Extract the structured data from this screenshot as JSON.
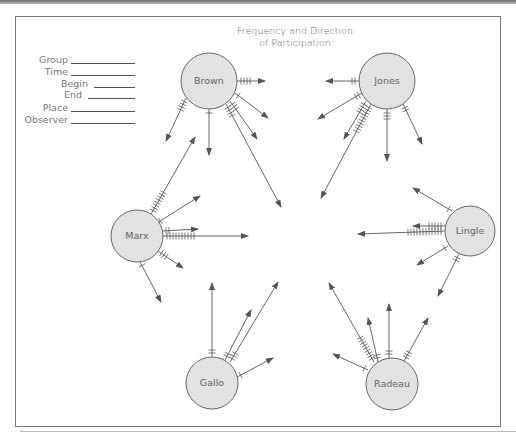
{
  "title": {
    "line1": "Frequency and Direction",
    "line2": "of Participation"
  },
  "form": {
    "fields": [
      {
        "label": "Group"
      },
      {
        "label": "Time"
      },
      {
        "label": "Begin"
      },
      {
        "label": "End"
      },
      {
        "label": "Place"
      },
      {
        "label": "Observer"
      }
    ]
  },
  "colors": {
    "node_fill": "#e2e2e2",
    "node_stroke": "#666666",
    "line": "#555555",
    "text": "#666666"
  },
  "nodes": [
    {
      "id": "brown",
      "label": "Brown",
      "cx": 209,
      "cy": 81,
      "r": 28
    },
    {
      "id": "jones",
      "label": "Jones",
      "cx": 387,
      "cy": 81,
      "r": 28
    },
    {
      "id": "marx",
      "label": "Marx",
      "cx": 137,
      "cy": 236,
      "r": 26
    },
    {
      "id": "lingle",
      "label": "Lingle",
      "cx": 470,
      "cy": 231,
      "r": 25
    },
    {
      "id": "gallo",
      "label": "Gallo",
      "cx": 212,
      "cy": 383,
      "r": 26
    },
    {
      "id": "radeau",
      "label": "Radeau",
      "cx": 392,
      "cy": 384,
      "r": 26
    }
  ],
  "arrows": [
    {
      "from": "brown",
      "x1": 237,
      "y1": 81,
      "x2": 265,
      "y2": 81,
      "ticks": 4
    },
    {
      "from": "brown",
      "x1": 235,
      "y1": 93,
      "x2": 268,
      "y2": 118,
      "ticks": 1
    },
    {
      "from": "brown",
      "x1": 230,
      "y1": 101,
      "x2": 257,
      "y2": 139,
      "ticks": 3
    },
    {
      "from": "brown",
      "x1": 226,
      "y1": 104,
      "x2": 281,
      "y2": 207,
      "ticks": 4
    },
    {
      "from": "brown",
      "x1": 209,
      "y1": 109,
      "x2": 209,
      "y2": 155,
      "ticks": 1
    },
    {
      "from": "brown",
      "x1": 186,
      "y1": 98,
      "x2": 166,
      "y2": 141,
      "ticks": 4
    },
    {
      "from": "jones",
      "x1": 359,
      "y1": 81,
      "x2": 326,
      "y2": 81,
      "ticks": 2
    },
    {
      "from": "jones",
      "x1": 362,
      "y1": 93,
      "x2": 318,
      "y2": 119,
      "ticks": 2
    },
    {
      "from": "jones",
      "x1": 366,
      "y1": 101,
      "x2": 344,
      "y2": 139,
      "ticks": 4
    },
    {
      "from": "jones",
      "x1": 371,
      "y1": 104,
      "x2": 321,
      "y2": 198,
      "ticks": 10
    },
    {
      "from": "jones",
      "x1": 387,
      "y1": 109,
      "x2": 387,
      "y2": 161,
      "ticks": 3
    },
    {
      "from": "jones",
      "x1": 403,
      "y1": 104,
      "x2": 422,
      "y2": 144,
      "ticks": 2
    },
    {
      "from": "marx",
      "x1": 151,
      "y1": 214,
      "x2": 195,
      "y2": 137,
      "ticks": 8
    },
    {
      "from": "marx",
      "x1": 157,
      "y1": 223,
      "x2": 200,
      "y2": 196,
      "ticks": 1
    },
    {
      "from": "marx",
      "x1": 162,
      "y1": 231,
      "x2": 198,
      "y2": 229,
      "ticks": 2
    },
    {
      "from": "marx",
      "x1": 163,
      "y1": 236,
      "x2": 248,
      "y2": 236,
      "ticks": 10
    },
    {
      "from": "marx",
      "x1": 158,
      "y1": 251,
      "x2": 183,
      "y2": 268,
      "ticks": 3
    },
    {
      "from": "marx",
      "x1": 140,
      "y1": 262,
      "x2": 161,
      "y2": 302,
      "ticks": 1
    },
    {
      "from": "lingle",
      "x1": 452,
      "y1": 211,
      "x2": 413,
      "y2": 188,
      "ticks": 1
    },
    {
      "from": "lingle",
      "x1": 445,
      "y1": 226,
      "x2": 413,
      "y2": 226,
      "ticks": 5
    },
    {
      "from": "lingle",
      "x1": 445,
      "y1": 231,
      "x2": 358,
      "y2": 234,
      "ticks": 12
    },
    {
      "from": "lingle",
      "x1": 448,
      "y1": 246,
      "x2": 417,
      "y2": 265,
      "ticks": 1
    },
    {
      "from": "lingle",
      "x1": 459,
      "y1": 254,
      "x2": 438,
      "y2": 296,
      "ticks": 2
    },
    {
      "from": "gallo",
      "x1": 212,
      "y1": 357,
      "x2": 212,
      "y2": 283,
      "ticks": 2
    },
    {
      "from": "gallo",
      "x1": 225,
      "y1": 360,
      "x2": 251,
      "y2": 310,
      "ticks": 2
    },
    {
      "from": "gallo",
      "x1": 230,
      "y1": 362,
      "x2": 278,
      "y2": 282,
      "ticks": 3
    },
    {
      "from": "gallo",
      "x1": 237,
      "y1": 377,
      "x2": 273,
      "y2": 358,
      "ticks": 1
    },
    {
      "from": "radeau",
      "x1": 368,
      "y1": 370,
      "x2": 333,
      "y2": 354,
      "ticks": 1
    },
    {
      "from": "radeau",
      "x1": 378,
      "y1": 362,
      "x2": 368,
      "y2": 318,
      "ticks": 2
    },
    {
      "from": "radeau",
      "x1": 374,
      "y1": 362,
      "x2": 329,
      "y2": 283,
      "ticks": 9
    },
    {
      "from": "radeau",
      "x1": 389,
      "y1": 358,
      "x2": 389,
      "y2": 304,
      "ticks": 2
    },
    {
      "from": "radeau",
      "x1": 404,
      "y1": 361,
      "x2": 428,
      "y2": 318,
      "ticks": 3
    }
  ]
}
